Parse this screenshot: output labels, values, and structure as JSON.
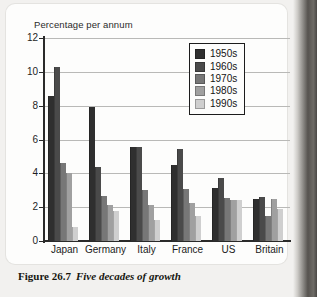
{
  "figure": {
    "caption_label": "Figure 26.7",
    "caption_text": "Five decades of growth"
  },
  "chart_data": {
    "type": "bar",
    "title": "",
    "ylabel": "Percentage per annum",
    "xlabel": "",
    "ylim": [
      0,
      12
    ],
    "yticks": [
      0,
      2,
      4,
      6,
      8,
      10,
      12
    ],
    "ytick_labels": [
      "0",
      "2",
      "4",
      "6",
      "8",
      "10",
      "12"
    ],
    "grid": true,
    "legend_position": "top-right",
    "categories": [
      "Japan",
      "Germany",
      "Italy",
      "France",
      "US",
      "Britain"
    ],
    "series": [
      {
        "name": "1950s",
        "color": "#2f2f2f",
        "values": [
          8.6,
          7.9,
          5.55,
          4.5,
          3.15,
          2.5
        ]
      },
      {
        "name": "1960s",
        "color": "#4a4a4a",
        "values": [
          10.3,
          4.4,
          5.55,
          5.45,
          3.75,
          2.6
        ]
      },
      {
        "name": "1970s",
        "color": "#777777",
        "values": [
          4.6,
          2.65,
          3.0,
          3.1,
          2.55,
          1.5
        ]
      },
      {
        "name": "1980s",
        "color": "#a0a0a0",
        "values": [
          4.0,
          2.1,
          2.1,
          2.25,
          2.4,
          2.5
        ]
      },
      {
        "name": "1990s",
        "color": "#cfcfcf",
        "values": [
          0.8,
          1.8,
          1.25,
          1.5,
          2.4,
          1.9
        ]
      }
    ]
  }
}
